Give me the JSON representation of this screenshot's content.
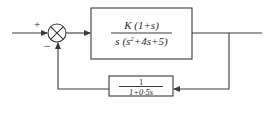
{
  "diagram": {
    "type": "closed-loop control block diagram",
    "summing_junction": {
      "plus_sign": "+",
      "minus_sign": "−"
    },
    "forward_block": {
      "numerator": "K (1+s)",
      "denominator_prefix": "s (s",
      "denominator_exp": "2",
      "denominator_suffix": "+4s+5)"
    },
    "feedback_block": {
      "numerator": "1",
      "denominator": "1+0·5s"
    },
    "colors": {
      "line": "#3a3a3a",
      "text": "#2a2a2a",
      "background": "#ffffff"
    }
  }
}
